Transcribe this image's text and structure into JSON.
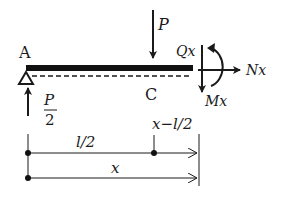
{
  "diagram": {
    "type": "beam-free-body-diagram",
    "labels": {
      "support_point": "A",
      "load_point": "C",
      "applied_load": "P",
      "reaction_num": "P",
      "reaction_den": "2",
      "shear": "Qx",
      "normal": "Nx",
      "moment": "Mx",
      "dim_half": "l/2",
      "dim_offset": "x−l/2",
      "dim_x": "x"
    },
    "colors": {
      "ink": "#1a1a1a",
      "background": "#ffffff"
    }
  }
}
